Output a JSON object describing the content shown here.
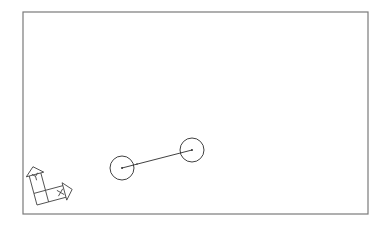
{
  "drawing": {
    "viewport": {
      "x": 23,
      "y": 12,
      "width": 345,
      "height": 202
    },
    "colors": {
      "frame": "#7a7a7a",
      "entity": "#2b2b2b",
      "background": "#ffffff"
    },
    "entities": [
      {
        "type": "circle",
        "cx": 122,
        "cy": 168,
        "r": 12
      },
      {
        "type": "circle",
        "cx": 192,
        "cy": 150,
        "r": 12
      },
      {
        "type": "line",
        "x1": 122,
        "y1": 168,
        "x2": 192,
        "y2": 150
      }
    ],
    "ucs_icon": {
      "x_label": "X",
      "y_label": "Y"
    }
  }
}
